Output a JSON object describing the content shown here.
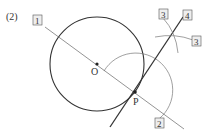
{
  "problem_label": "(2)",
  "points": {
    "O": {
      "label": "O",
      "x": 97,
      "y": 64
    },
    "P": {
      "label": "P",
      "x": 135,
      "y": 92
    }
  },
  "step_labels": {
    "step1": "1",
    "step2": "2",
    "step3a": "3",
    "step3b": "3",
    "step4": "4"
  },
  "colors": {
    "stroke": "#333333",
    "thin_stroke": "#777777"
  }
}
